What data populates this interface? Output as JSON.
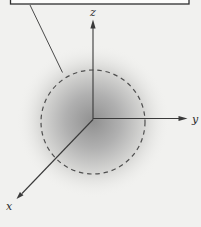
{
  "figure": {
    "axis_labels": {
      "x": "x",
      "y": "y",
      "z": "z"
    },
    "colors": {
      "background": "#f1f1ef",
      "axis_line": "#3a3a3a",
      "dashed_circle": "#4f4f4f",
      "leader_line": "#4a4a4a",
      "callout_box_border": "#2e2e2e",
      "cloud_center": "#909090",
      "cloud_mid": "#b0b0b0",
      "cloud_outer": "#d6d6d4",
      "cloud_fade": "#f1f1ef"
    }
  }
}
